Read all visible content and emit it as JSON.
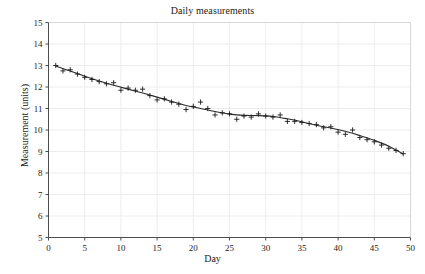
{
  "chart_data": {
    "type": "scatter",
    "title": "Daily measurements",
    "xlabel": "Day",
    "ylabel": "Measurement (units)",
    "xlim": [
      0,
      50
    ],
    "ylim": [
      5,
      15
    ],
    "xticks": [
      0,
      5,
      10,
      15,
      20,
      25,
      30,
      35,
      40,
      45,
      50
    ],
    "yticks": [
      5,
      6,
      7,
      8,
      9,
      10,
      11,
      12,
      13,
      14,
      15
    ],
    "grid": true,
    "legend": null,
    "marker": "plus",
    "marker_color": "#1a1a1a",
    "line_color": "#2b2b2b",
    "grid_color": "#ededed",
    "frame_color": "#4d4d4d",
    "background": "#ffffff",
    "x": [
      1,
      2,
      3,
      4,
      5,
      6,
      7,
      8,
      9,
      10,
      11,
      12,
      13,
      14,
      15,
      16,
      17,
      18,
      19,
      20,
      21,
      22,
      23,
      24,
      25,
      26,
      27,
      28,
      29,
      30,
      31,
      32,
      33,
      34,
      35,
      36,
      37,
      38,
      39,
      40,
      41,
      42,
      43,
      44,
      45,
      46,
      47,
      48,
      49
    ],
    "y": [
      13.0,
      12.75,
      12.8,
      12.6,
      12.45,
      12.35,
      12.25,
      12.15,
      12.2,
      11.85,
      11.95,
      11.85,
      11.9,
      11.6,
      11.4,
      11.45,
      11.3,
      11.2,
      10.95,
      11.1,
      11.3,
      11.0,
      10.7,
      10.8,
      10.75,
      10.5,
      10.65,
      10.6,
      10.75,
      10.65,
      10.6,
      10.7,
      10.4,
      10.4,
      10.35,
      10.3,
      10.25,
      10.1,
      10.15,
      9.9,
      9.8,
      10.0,
      9.65,
      9.55,
      9.45,
      9.3,
      9.15,
      9.05,
      8.9
    ],
    "trend": {
      "name": "smoothed trend",
      "x": [
        1,
        3,
        5,
        7,
        9,
        11,
        13,
        15,
        17,
        19,
        21,
        23,
        25,
        27,
        29,
        31,
        33,
        35,
        37,
        39,
        41,
        43,
        45,
        47,
        49
      ],
      "y": [
        12.98,
        12.74,
        12.5,
        12.28,
        12.08,
        11.9,
        11.72,
        11.53,
        11.33,
        11.14,
        11.0,
        10.86,
        10.74,
        10.68,
        10.67,
        10.63,
        10.52,
        10.38,
        10.22,
        10.09,
        9.94,
        9.74,
        9.52,
        9.25,
        8.88
      ]
    }
  }
}
